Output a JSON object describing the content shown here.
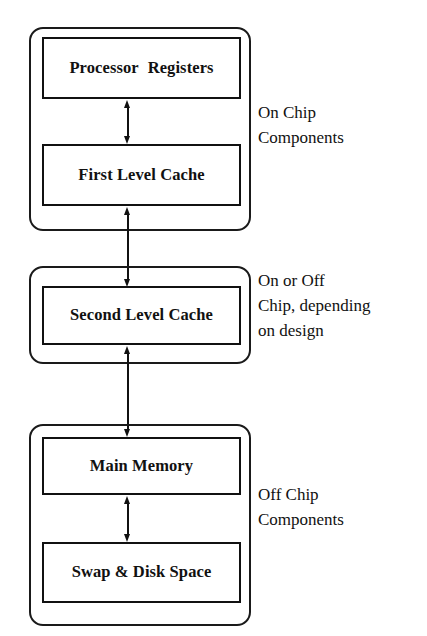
{
  "diagram": {
    "background_color": "#ffffff",
    "line_color": "#111111",
    "groups": [
      {
        "id": "on-chip",
        "annotation_lines": [
          "On Chip",
          "Components"
        ],
        "boxes": [
          {
            "id": "processor-registers",
            "label": "Processor  Registers"
          },
          {
            "id": "first-level-cache",
            "label": "First Level Cache"
          }
        ]
      },
      {
        "id": "on-or-off-chip",
        "annotation_lines": [
          "On or Off",
          "Chip, depending",
          "on design"
        ],
        "boxes": [
          {
            "id": "second-level-cache",
            "label": "Second Level Cache"
          }
        ]
      },
      {
        "id": "off-chip",
        "annotation_lines": [
          "Off Chip",
          "Components"
        ],
        "boxes": [
          {
            "id": "main-memory",
            "label": "Main Memory"
          },
          {
            "id": "swap-disk-space",
            "label": "Swap & Disk Space"
          }
        ]
      }
    ],
    "connectors": [
      {
        "id": "registers-to-l1",
        "from": "processor-registers",
        "to": "first-level-cache",
        "style": "double-arrow"
      },
      {
        "id": "l1-to-l2",
        "from": "first-level-cache",
        "to": "second-level-cache",
        "style": "double-arrow"
      },
      {
        "id": "l2-to-memory",
        "from": "second-level-cache",
        "to": "main-memory",
        "style": "double-arrow"
      },
      {
        "id": "memory-to-swap",
        "from": "main-memory",
        "to": "swap-disk-space",
        "style": "double-arrow"
      }
    ]
  }
}
